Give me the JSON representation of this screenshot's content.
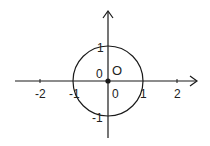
{
  "diagram": {
    "type": "unit-circle-on-axes",
    "origin_label": "O",
    "circle": {
      "center": [
        0,
        0
      ],
      "radius": 1
    },
    "x_axis": {
      "tick_labels": [
        "-2",
        "-1",
        "0",
        "1",
        "2"
      ]
    },
    "y_axis": {
      "tick_labels": [
        "1",
        "0",
        "-1"
      ]
    },
    "labels": {
      "x_neg2": "-2",
      "x_neg1": "-1",
      "x_zero": "0",
      "x_pos1": "1",
      "x_pos2": "2",
      "y_pos1": "1",
      "y_zero": "0",
      "y_neg1": "-1",
      "origin": "O"
    },
    "colors": {
      "stroke": "#1a1a1a",
      "background": "#ffffff"
    }
  }
}
